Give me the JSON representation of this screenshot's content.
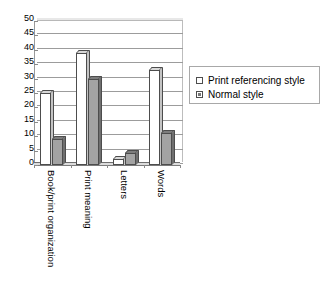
{
  "chart_data": {
    "type": "bar",
    "title": "",
    "subtitle": "",
    "xlabel": "",
    "ylabel": "",
    "ylim": [
      0,
      50
    ],
    "ytick_step": 5,
    "yticks": [
      50,
      45,
      40,
      35,
      30,
      25,
      20,
      15,
      10,
      5,
      0
    ],
    "grid": true,
    "grid_axis": "y",
    "legend_position": "right",
    "categories": [
      "Book/print organization",
      "Print meaning",
      "Letters",
      "Words"
    ],
    "series": [
      {
        "name": "Print referencing style",
        "color": "#ffffff",
        "values": [
          25,
          39,
          2,
          33
        ]
      },
      {
        "name": "Normal style",
        "color": "#a3a3a3",
        "values": [
          9,
          30,
          4,
          11
        ]
      }
    ]
  },
  "legend": {
    "entries": [
      {
        "label": "Print referencing style"
      },
      {
        "label": "Normal style"
      }
    ]
  },
  "icons": {
    "legend_swatch_open": "open-square-swatch",
    "legend_swatch_filled": "filled-square-swatch"
  }
}
